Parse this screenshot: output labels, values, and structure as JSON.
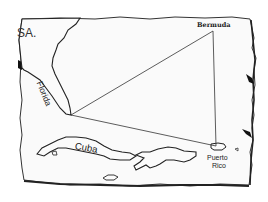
{
  "map": {
    "title": "Bermuda Triangle",
    "style": "hand-drawn parchment map",
    "labels": {
      "usa": "SA.",
      "bermuda": "Bermuda",
      "florida": "Florida",
      "cuba": "Cuba",
      "puerto_rico_line1": "Puerto",
      "puerto_rico_line2": "Rico"
    },
    "triangle": {
      "vertices": [
        {
          "name": "Florida",
          "x": 71,
          "y": 115
        },
        {
          "name": "Bermuda",
          "x": 213,
          "y": 31
        },
        {
          "name": "Puerto Rico",
          "x": 216,
          "y": 146
        }
      ]
    },
    "colors": {
      "ink": "#222222",
      "parchment": "#fafafa",
      "background": "#ffffff"
    }
  }
}
